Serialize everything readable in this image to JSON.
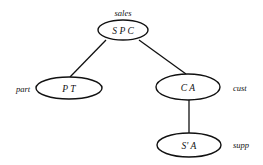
{
  "diagram": {
    "type": "tree",
    "nodes": [
      {
        "id": "sales",
        "label": "sales",
        "attributes": "S   P  C",
        "cx": 123,
        "cy": 30,
        "rx": 25,
        "ry": 10,
        "label_x": 123,
        "label_y": 16,
        "label_anchor": "middle"
      },
      {
        "id": "part",
        "label": "part",
        "attributes": "P    T",
        "cx": 69,
        "cy": 88,
        "rx": 33,
        "ry": 11,
        "label_x": 16,
        "label_y": 92,
        "label_anchor": "start"
      },
      {
        "id": "cust",
        "label": "cust",
        "attributes": "C    A",
        "cx": 188,
        "cy": 87,
        "rx": 32,
        "ry": 13,
        "label_x": 233,
        "label_y": 91,
        "label_anchor": "start"
      },
      {
        "id": "supp",
        "label": "supp",
        "attributes": "S'   A",
        "cx": 189,
        "cy": 145,
        "rx": 32,
        "ry": 12,
        "label_x": 233,
        "label_y": 148,
        "label_anchor": "start"
      }
    ],
    "edges": [
      {
        "from": "sales",
        "to": "part",
        "x1": 106,
        "y1": 40,
        "x2": 70,
        "y2": 77
      },
      {
        "from": "sales",
        "to": "cust",
        "x1": 139,
        "y1": 40,
        "x2": 186,
        "y2": 74
      },
      {
        "from": "cust",
        "to": "supp",
        "x1": 189,
        "y1": 100,
        "x2": 189,
        "y2": 133
      }
    ]
  }
}
